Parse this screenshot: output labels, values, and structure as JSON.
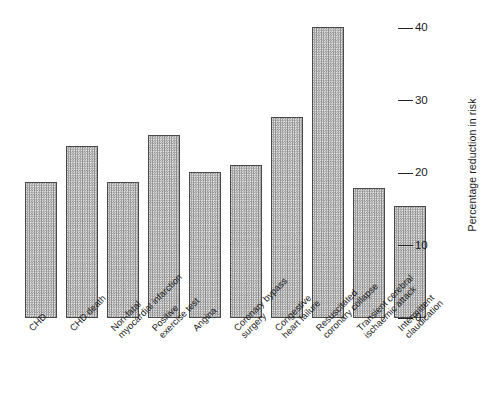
{
  "chart_data": {
    "type": "bar",
    "title": "",
    "xlabel": "",
    "ylabel": "Percentage reduction in risk",
    "ylim": [
      0,
      43
    ],
    "yticks": [
      0,
      10,
      20,
      30,
      40
    ],
    "ytick_labels": [
      "0",
      "10",
      "20",
      "30",
      "40"
    ],
    "grid": false,
    "legend": "none",
    "orientation": "vertical",
    "categories": [
      "CHD",
      "CHD death",
      "Non-fatal myocardial infarction",
      "Positive exercise test",
      "Angina",
      "Coronary bypass surgery",
      "Congestive heart failure",
      "Resuscitated coronary collapse",
      "Transient cerebral ischaemic attack",
      "Intermittent claudication"
    ],
    "values": [
      18.8,
      23.7,
      18.8,
      25.2,
      20.1,
      21.1,
      27.7,
      40.1,
      17.9,
      15.4
    ]
  },
  "axis": {
    "y_title": "Percentage reduction in risk",
    "ticks": [
      {
        "value": 40,
        "label": "40"
      },
      {
        "value": 30,
        "label": "30"
      },
      {
        "value": 20,
        "label": "20"
      },
      {
        "value": 10,
        "label": "10"
      },
      {
        "value": 0,
        "label": "0"
      }
    ]
  },
  "bars": [
    {
      "value": 18.8,
      "line1": "CHD",
      "line2": ""
    },
    {
      "value": 23.7,
      "line1": "CHD death",
      "line2": ""
    },
    {
      "value": 18.8,
      "line1": "Non-fatal",
      "line2": "myocardial infarction"
    },
    {
      "value": 25.2,
      "line1": "Positive",
      "line2": "exercise test"
    },
    {
      "value": 20.1,
      "line1": "Angina",
      "line2": ""
    },
    {
      "value": 21.1,
      "line1": "Coronary bypass",
      "line2": "surgery"
    },
    {
      "value": 27.7,
      "line1": "Congestive",
      "line2": "heart failure"
    },
    {
      "value": 40.1,
      "line1": "Resuscitated",
      "line2": "coronary collapse"
    },
    {
      "value": 17.9,
      "line1": "Transient cerebral",
      "line2": "ischaemic attack"
    },
    {
      "value": 15.4,
      "line1": "Intermittent",
      "line2": "claudication"
    }
  ],
  "style": {
    "bar_fill": "#c9c9c9",
    "bar_border": "#4a4a4a",
    "text_color": "#1a1a1a",
    "background": "#ffffff"
  }
}
